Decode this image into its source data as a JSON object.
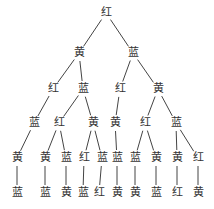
{
  "diagram": {
    "type": "tree",
    "line_color": "#444444",
    "text_color": "#333333",
    "nodes": [
      {
        "id": "n0",
        "label": "红",
        "x": 106,
        "y": 13
      },
      {
        "id": "n1",
        "label": "黄",
        "x": 79,
        "y": 53
      },
      {
        "id": "n2",
        "label": "蓝",
        "x": 133,
        "y": 53
      },
      {
        "id": "n3",
        "label": "红",
        "x": 53,
        "y": 89
      },
      {
        "id": "n4",
        "label": "蓝",
        "x": 83,
        "y": 89
      },
      {
        "id": "n5",
        "label": "红",
        "x": 120,
        "y": 89
      },
      {
        "id": "n6",
        "label": "黄",
        "x": 158,
        "y": 89
      },
      {
        "id": "n7",
        "label": "蓝",
        "x": 34,
        "y": 123
      },
      {
        "id": "n8",
        "label": "红",
        "x": 59,
        "y": 123
      },
      {
        "id": "n9",
        "label": "黄",
        "x": 93,
        "y": 123
      },
      {
        "id": "n10",
        "label": "黄",
        "x": 115,
        "y": 123
      },
      {
        "id": "n11",
        "label": "红",
        "x": 145,
        "y": 123
      },
      {
        "id": "n12",
        "label": "蓝",
        "x": 176,
        "y": 123
      },
      {
        "id": "n13",
        "label": "黄",
        "x": 17,
        "y": 158
      },
      {
        "id": "n14",
        "label": "黄",
        "x": 45,
        "y": 158
      },
      {
        "id": "n15",
        "label": "蓝",
        "x": 66,
        "y": 158
      },
      {
        "id": "n16",
        "label": "红",
        "x": 84,
        "y": 158
      },
      {
        "id": "n17",
        "label": "蓝",
        "x": 102,
        "y": 158
      },
      {
        "id": "n18",
        "label": "蓝",
        "x": 117,
        "y": 158
      },
      {
        "id": "n19",
        "label": "蓝",
        "x": 135,
        "y": 158
      },
      {
        "id": "n20",
        "label": "黄",
        "x": 156,
        "y": 158
      },
      {
        "id": "n21",
        "label": "黄",
        "x": 177,
        "y": 158
      },
      {
        "id": "n22",
        "label": "红",
        "x": 198,
        "y": 158
      },
      {
        "id": "n23",
        "label": "蓝",
        "x": 17,
        "y": 193
      },
      {
        "id": "n24",
        "label": "蓝",
        "x": 45,
        "y": 193
      },
      {
        "id": "n25",
        "label": "黄",
        "x": 66,
        "y": 193
      },
      {
        "id": "n26",
        "label": "蓝",
        "x": 83,
        "y": 193
      },
      {
        "id": "n27",
        "label": "红",
        "x": 99,
        "y": 193
      },
      {
        "id": "n28",
        "label": "黄",
        "x": 117,
        "y": 193
      },
      {
        "id": "n29",
        "label": "黄",
        "x": 135,
        "y": 193
      },
      {
        "id": "n30",
        "label": "蓝",
        "x": 156,
        "y": 193
      },
      {
        "id": "n31",
        "label": "红",
        "x": 177,
        "y": 193
      },
      {
        "id": "n32",
        "label": "黄",
        "x": 198,
        "y": 193
      }
    ],
    "edges": [
      [
        "n0",
        "n1"
      ],
      [
        "n0",
        "n2"
      ],
      [
        "n1",
        "n3"
      ],
      [
        "n1",
        "n4"
      ],
      [
        "n2",
        "n5"
      ],
      [
        "n2",
        "n6"
      ],
      [
        "n3",
        "n7"
      ],
      [
        "n4",
        "n8"
      ],
      [
        "n4",
        "n9"
      ],
      [
        "n5",
        "n10"
      ],
      [
        "n6",
        "n11"
      ],
      [
        "n6",
        "n12"
      ],
      [
        "n7",
        "n13"
      ],
      [
        "n8",
        "n14"
      ],
      [
        "n8",
        "n15"
      ],
      [
        "n9",
        "n16"
      ],
      [
        "n9",
        "n17"
      ],
      [
        "n10",
        "n18"
      ],
      [
        "n11",
        "n19"
      ],
      [
        "n11",
        "n20"
      ],
      [
        "n12",
        "n21"
      ],
      [
        "n12",
        "n22"
      ],
      [
        "n13",
        "n23"
      ],
      [
        "n14",
        "n24"
      ],
      [
        "n15",
        "n25"
      ],
      [
        "n16",
        "n26"
      ],
      [
        "n17",
        "n27"
      ],
      [
        "n18",
        "n28"
      ],
      [
        "n19",
        "n29"
      ],
      [
        "n20",
        "n30"
      ],
      [
        "n21",
        "n31"
      ],
      [
        "n22",
        "n32"
      ]
    ]
  }
}
